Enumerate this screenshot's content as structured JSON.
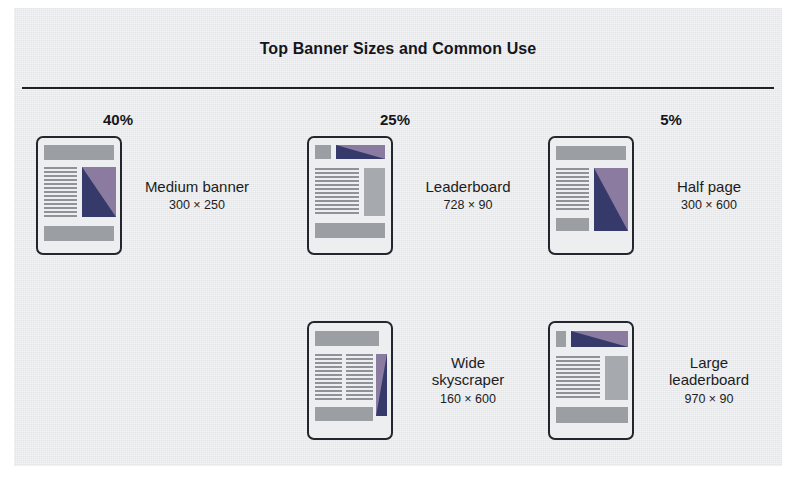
{
  "panel": {
    "background_color": "#e9eaec",
    "border_color": "#23262f"
  },
  "header": {
    "title": "Top Banner Sizes and Common Use"
  },
  "colors": {
    "ad_purple": "#8b7ba0",
    "ad_navy": "#353a6b",
    "bar_gray": "#9b9ea3",
    "text": "#1b1d22",
    "rule": "#1d2027"
  },
  "percentages": [
    {
      "value": "40%",
      "for": "Medium banner"
    },
    {
      "value": "25%",
      "for": "Leaderboard"
    },
    {
      "value": "5%",
      "for": "Half page"
    }
  ],
  "items": [
    {
      "name": "Medium banner",
      "dimensions": "300 × 250",
      "percent": "40%",
      "thumbnail": "medium-banner-layout"
    },
    {
      "name": "Leaderboard",
      "dimensions": "728 × 90",
      "percent": "25%",
      "thumbnail": "leaderboard-layout"
    },
    {
      "name": "Half page",
      "dimensions": "300 × 600",
      "percent": "5%",
      "thumbnail": "half-page-layout"
    },
    {
      "name": "Wide skyscraper",
      "name_line1": "Wide",
      "name_line2": "skyscraper",
      "dimensions": "160 × 600",
      "percent": "",
      "thumbnail": "wide-skyscraper-layout"
    },
    {
      "name": "Large leaderboard",
      "name_line1": "Large",
      "name_line2": "leaderboard",
      "dimensions": "970 × 90",
      "percent": "",
      "thumbnail": "large-leaderboard-layout"
    }
  ]
}
